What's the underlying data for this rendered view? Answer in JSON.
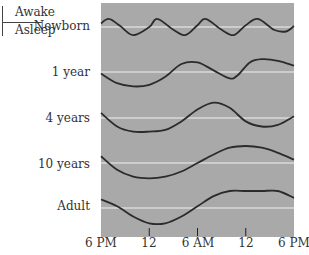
{
  "chart_data": {
    "type": "line",
    "title": "",
    "legend": {
      "awake": "Awake",
      "asleep": "Asleep"
    },
    "xlabel": "",
    "ylabel": "",
    "x_ticks": [
      "6 PM",
      "12",
      "6 AM",
      "12",
      "6 PM"
    ],
    "x_hours": [
      0,
      6,
      12,
      18,
      24
    ],
    "grid": false,
    "panel_color": "#a9a9a9",
    "baseline_color": "#f2f2f2",
    "curve_color": "#2b2b2b",
    "series": [
      {
        "name": "Newborn",
        "description": "~5 short sleep/wake cycles per 24h",
        "points": [
          [
            0,
            0.4
          ],
          [
            1,
            0.9
          ],
          [
            2.4,
            0.1
          ],
          [
            4,
            -0.9
          ],
          [
            6,
            0.0
          ],
          [
            7,
            0.9
          ],
          [
            9,
            -0.3
          ],
          [
            10.5,
            -0.9
          ],
          [
            12,
            0.2
          ],
          [
            13,
            0.9
          ],
          [
            15,
            -0.3
          ],
          [
            16.5,
            -0.9
          ],
          [
            18,
            0.2
          ],
          [
            19.5,
            0.9
          ],
          [
            21.5,
            -0.3
          ],
          [
            23,
            -0.5
          ],
          [
            24,
            0.1
          ]
        ]
      },
      {
        "name": "1 year",
        "description": "daytime naps + long night sleep",
        "points": [
          [
            0,
            -0.1
          ],
          [
            2,
            -0.7
          ],
          [
            4,
            -0.9
          ],
          [
            6,
            -0.8
          ],
          [
            8,
            -0.3
          ],
          [
            10,
            0.5
          ],
          [
            12,
            0.6
          ],
          [
            14,
            0.1
          ],
          [
            16,
            -0.4
          ],
          [
            17,
            -0.2
          ],
          [
            18.5,
            0.6
          ],
          [
            20,
            0.8
          ],
          [
            22,
            0.7
          ],
          [
            24,
            0.4
          ]
        ]
      },
      {
        "name": "4 years",
        "description": "one long sleep, one nap",
        "points": [
          [
            0,
            0.3
          ],
          [
            2,
            -0.5
          ],
          [
            4,
            -0.8
          ],
          [
            6,
            -0.8
          ],
          [
            8,
            -0.7
          ],
          [
            10,
            -0.2
          ],
          [
            12,
            0.5
          ],
          [
            14,
            0.9
          ],
          [
            16,
            0.6
          ],
          [
            18,
            -0.2
          ],
          [
            20,
            -0.5
          ],
          [
            22,
            -0.4
          ],
          [
            24,
            0.1
          ]
        ]
      },
      {
        "name": "10 years",
        "description": "single consolidated sleep period",
        "points": [
          [
            0,
            0.4
          ],
          [
            2,
            -0.4
          ],
          [
            4,
            -0.8
          ],
          [
            6,
            -0.9
          ],
          [
            8,
            -0.8
          ],
          [
            10,
            -0.5
          ],
          [
            12,
            0.0
          ],
          [
            14,
            0.5
          ],
          [
            16,
            0.9
          ],
          [
            18,
            1.0
          ],
          [
            20,
            0.9
          ],
          [
            22,
            0.6
          ],
          [
            24,
            0.2
          ]
        ]
      },
      {
        "name": "Adult",
        "description": "single consolidated sleep period",
        "points": [
          [
            0,
            0.5
          ],
          [
            2,
            0.1
          ],
          [
            4,
            -0.5
          ],
          [
            6,
            -0.9
          ],
          [
            8,
            -0.9
          ],
          [
            10,
            -0.5
          ],
          [
            12,
            0.1
          ],
          [
            14,
            0.7
          ],
          [
            16,
            1.0
          ],
          [
            18,
            1.0
          ],
          [
            20,
            1.0
          ],
          [
            22,
            1.0
          ],
          [
            24,
            0.6
          ]
        ]
      }
    ]
  }
}
